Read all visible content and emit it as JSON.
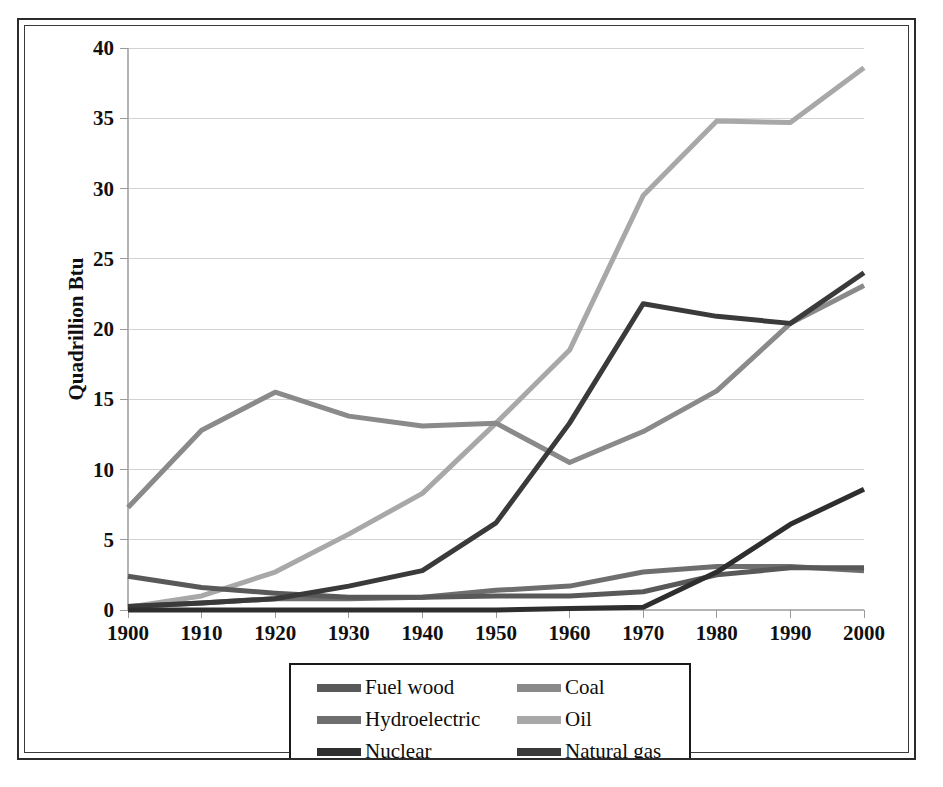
{
  "chart_data": {
    "type": "line",
    "title": "",
    "xlabel": "",
    "ylabel": "Quadrillion Btu",
    "categories": [
      1900,
      1910,
      1920,
      1930,
      1940,
      1950,
      1960,
      1970,
      1980,
      1990,
      2000
    ],
    "x": [
      1900,
      1910,
      1920,
      1930,
      1940,
      1950,
      1960,
      1970,
      1980,
      1990,
      2000
    ],
    "xtick_labels": [
      "1900",
      "1910",
      "1920",
      "1930",
      "1940",
      "1950",
      "1960",
      "1970",
      "1980",
      "1990",
      "2000"
    ],
    "ytick_labels": [
      "0",
      "5",
      "10",
      "15",
      "20",
      "25",
      "30",
      "35",
      "40"
    ],
    "yticks": [
      0,
      5,
      10,
      15,
      20,
      25,
      30,
      35,
      40
    ],
    "ylim": [
      0,
      40
    ],
    "xlim": [
      1900,
      2000
    ],
    "grid": true,
    "legend_position": "below-center",
    "series": [
      {
        "name": "Fuel wood",
        "color": "#595959",
        "values": [
          2.4,
          1.6,
          1.2,
          0.9,
          0.9,
          1.0,
          1.0,
          1.3,
          2.5,
          3.0,
          3.0
        ]
      },
      {
        "name": "Coal",
        "color": "#8a8a8a",
        "values": [
          7.3,
          12.8,
          15.5,
          13.8,
          13.1,
          13.3,
          10.5,
          12.7,
          15.6,
          20.4,
          23.1
        ]
      },
      {
        "name": "Hydroelectric",
        "color": "#6e6e6e",
        "values": [
          0.25,
          0.5,
          0.8,
          0.8,
          0.9,
          1.4,
          1.7,
          2.7,
          3.1,
          3.1,
          2.8
        ]
      },
      {
        "name": "Oil",
        "color": "#a8a8a8",
        "values": [
          0.2,
          1.0,
          2.7,
          5.4,
          8.3,
          13.3,
          18.5,
          29.5,
          34.8,
          34.7,
          38.6
        ]
      },
      {
        "name": "Nuclear",
        "color": "#2e2e2e",
        "values": [
          0.0,
          0.0,
          0.0,
          0.0,
          0.0,
          0.0,
          0.1,
          0.2,
          2.7,
          6.1,
          8.6
        ]
      },
      {
        "name": "Natural gas",
        "color": "#3a3a3a",
        "values": [
          0.25,
          0.5,
          0.8,
          1.7,
          2.8,
          6.2,
          13.3,
          21.8,
          20.9,
          20.4,
          24.0
        ]
      }
    ],
    "legend_entries": [
      {
        "label": "Fuel wood",
        "color": "#595959"
      },
      {
        "label": "Coal",
        "color": "#8a8a8a"
      },
      {
        "label": "Hydroelectric",
        "color": "#6e6e6e"
      },
      {
        "label": "Oil",
        "color": "#a8a8a8"
      },
      {
        "label": "Nuclear",
        "color": "#2e2e2e"
      },
      {
        "label": "Natural gas",
        "color": "#3a3a3a"
      }
    ]
  },
  "colors": {
    "frame": "#2b2b2b",
    "gridline": "#d2d2d2",
    "background": "#ffffff",
    "text": "#101010"
  }
}
